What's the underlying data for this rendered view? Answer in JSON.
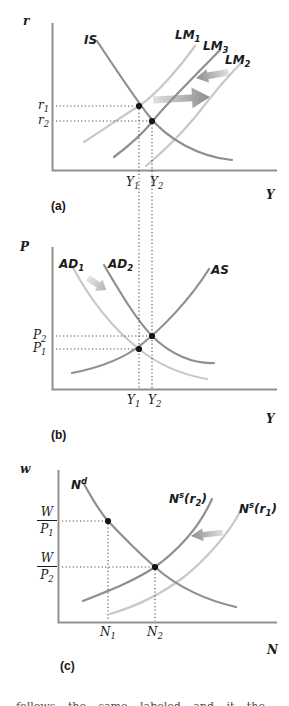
{
  "colors": {
    "curve_dark": "#8f8f8f",
    "curve_light": "#c8c8c8",
    "axis": "#909090",
    "dot": "#161616",
    "dotted_line": "#4d4d4d",
    "text": "#1b1b1b"
  },
  "panel_a": {
    "label": "(a)",
    "y_var": "r",
    "x_var": "Y",
    "is": "IS",
    "lm1_base": "LM",
    "lm1_sub": "1",
    "lm3_base": "LM",
    "lm3_sub": "3",
    "lm2_base": "LM",
    "lm2_sub": "2",
    "r1_base": "r",
    "r1_sub": "1",
    "r2_base": "r",
    "r2_sub": "2",
    "y1_base": "Y",
    "y1_sub": "1",
    "y2_base": "Y",
    "y2_sub": "2"
  },
  "panel_b": {
    "label": "(b)",
    "y_var": "P",
    "x_var": "Y",
    "ad1_base": "AD",
    "ad1_sub": "1",
    "ad2_base": "AD",
    "ad2_sub": "2",
    "as": "AS",
    "p2_base": "P",
    "p2_sub": "2",
    "p1_base": "P",
    "p1_sub": "1",
    "y1_base": "Y",
    "y1_sub": "1",
    "y2_base": "Y",
    "y2_sub": "2"
  },
  "panel_c": {
    "label": "(c)",
    "y_var": "w",
    "x_var": "N",
    "nd_base": "N",
    "nd_sup": "d",
    "ns2_base": "N",
    "ns2_sup": "s",
    "ns2_pre": "(r",
    "ns2_sub": "2",
    "ns2_post": ")",
    "ns1_base": "N",
    "ns1_sup": "s",
    "ns1_pre": "(r",
    "ns1_sub": "1",
    "ns1_post": ")",
    "frac1_num": "W",
    "frac1_den_base": "P",
    "frac1_den_sub": "1",
    "frac2_num": "W",
    "frac2_den_base": "P",
    "frac2_den_sub": "2",
    "n1_base": "N",
    "n1_sub": "1",
    "n2_base": "N",
    "n2_sub": "2"
  },
  "caption_fragment": "follows the same labeled and it the"
}
